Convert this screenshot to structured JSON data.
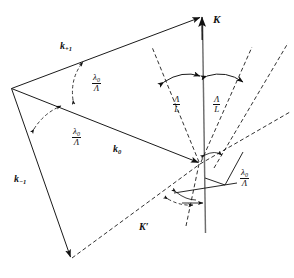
{
  "figure": {
    "width": 294,
    "height": 278,
    "background": "#ffffff",
    "ink": "#111111"
  },
  "labels": {
    "k_plus1": {
      "symbol": "k",
      "subscript": "+1",
      "x": 60,
      "y": 41
    },
    "k_zero": {
      "symbol": "k",
      "subscript": "0",
      "x": 113,
      "y": 144
    },
    "k_minus1": {
      "symbol": "k",
      "subscript": "−1",
      "x": 14,
      "y": 174
    },
    "K": {
      "symbol": "K",
      "subscript": "",
      "x": 213,
      "y": 14
    },
    "K_prime": {
      "symbol": "K′",
      "subscript": "",
      "x": 139,
      "y": 222
    }
  },
  "fractions": {
    "lambda_over_Lambda_upper": {
      "numerator": "λ",
      "numerator_sub": "0",
      "denominator": "Λ",
      "x": 92,
      "y": 73
    },
    "lambda_over_Lambda_lower": {
      "numerator": "λ",
      "numerator_sub": "0",
      "denominator": "Λ",
      "x": 72,
      "y": 127
    },
    "lambda_over_Lambda_right": {
      "numerator": "λ",
      "numerator_sub": "0",
      "denominator": "Λ",
      "x": 240,
      "y": 168
    },
    "Lambda_over_L_left": {
      "numerator": "Λ",
      "numerator_sub": "",
      "denominator": "L",
      "x": 173,
      "y": 95
    },
    "Lambda_over_L_right": {
      "numerator": "Λ",
      "numerator_sub": "",
      "denominator": "L",
      "x": 213,
      "y": 95
    }
  },
  "geometry": {
    "origin_vertex": {
      "x": 200,
      "y": 163
    },
    "left_vertex": {
      "x": 11,
      "y": 88
    },
    "top_apex": {
      "x": 202,
      "y": 16
    },
    "bottom_apex": {
      "x": 71,
      "y": 258
    },
    "axis_top": {
      "x": 202,
      "y": 16
    },
    "axis_bottom": {
      "x": 205,
      "y": 233
    }
  },
  "elements": {
    "solid_vectors": [
      "k_plus1_arrow",
      "k_zero_arrow",
      "k_minus1_arrow",
      "K_axis_arrow",
      "top_chord",
      "bottom_chord_solid",
      "right_leader_line",
      "lower_horizontal_tick"
    ],
    "dashed_lines": [
      "grating-order-dashed-left",
      "grating-order-dashed-right-inner",
      "grating-order-dashed-right-outer",
      "K-prime-dashed",
      "k-minus1-dashed-return",
      "lower-right-dashed"
    ],
    "angle_arcs": [
      "arc-lambda-upper",
      "arc-lambda-lower",
      "arc-Lambda-L-left",
      "arc-Lambda-L-right",
      "arc-lambda-right-upper",
      "arc-lambda-lower-right",
      "arc-K-prime"
    ]
  }
}
